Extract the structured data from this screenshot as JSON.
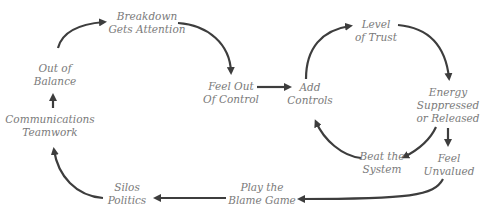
{
  "diagram": {
    "type": "feedback-loop",
    "arrow_color": "#3d3d3d",
    "text_color": "#7a7a7a",
    "nodes": [
      {
        "id": "breakdown",
        "lines": [
          "Breakdown",
          "Gets Attention"
        ]
      },
      {
        "id": "feel-out-of-control",
        "lines": [
          "Feel Out",
          "Of Control"
        ]
      },
      {
        "id": "add-controls",
        "lines": [
          "Add",
          "Controls"
        ]
      },
      {
        "id": "level-of-trust",
        "lines": [
          "Level",
          "of Trust"
        ]
      },
      {
        "id": "energy",
        "lines": [
          "Energy",
          "Suppressed",
          "or Released"
        ]
      },
      {
        "id": "beat-the-system",
        "lines": [
          "Beat the",
          "System"
        ]
      },
      {
        "id": "feel-unvalued",
        "lines": [
          "Feel",
          "Unvalued"
        ]
      },
      {
        "id": "play-the-blame-game",
        "lines": [
          "Play the",
          "Blame Game"
        ]
      },
      {
        "id": "silos-politics",
        "lines": [
          "Silos",
          "Politics"
        ]
      },
      {
        "id": "communications-teamwork",
        "lines": [
          "Communications",
          "Teamwork"
        ]
      },
      {
        "id": "out-of-balance",
        "lines": [
          "Out of",
          "Balance"
        ]
      }
    ],
    "edges": [
      {
        "from": "out-of-balance",
        "to": "breakdown"
      },
      {
        "from": "breakdown",
        "to": "feel-out-of-control"
      },
      {
        "from": "feel-out-of-control",
        "to": "add-controls"
      },
      {
        "from": "add-controls",
        "to": "level-of-trust"
      },
      {
        "from": "level-of-trust",
        "to": "energy"
      },
      {
        "from": "energy",
        "to": "beat-the-system"
      },
      {
        "from": "beat-the-system",
        "to": "add-controls"
      },
      {
        "from": "energy",
        "to": "feel-unvalued"
      },
      {
        "from": "feel-unvalued",
        "to": "play-the-blame-game"
      },
      {
        "from": "play-the-blame-game",
        "to": "silos-politics"
      },
      {
        "from": "silos-politics",
        "to": "communications-teamwork"
      },
      {
        "from": "communications-teamwork",
        "to": "out-of-balance"
      }
    ]
  }
}
